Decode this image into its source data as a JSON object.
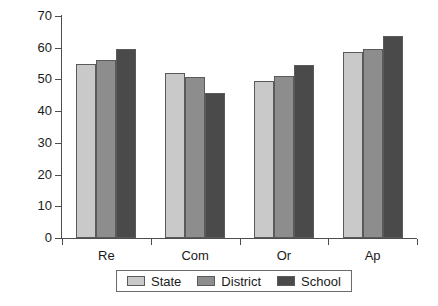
{
  "chart_data": {
    "type": "bar",
    "title": "",
    "subtitle": "",
    "xlabel": "",
    "ylabel": "",
    "categories": [
      "Re",
      "Com",
      "Or",
      "Ap"
    ],
    "series": [
      {
        "name": "State",
        "color": "#c9c9c9",
        "values": [
          55.0,
          52.0,
          49.5,
          58.7
        ]
      },
      {
        "name": "District",
        "color": "#8d8d8d",
        "values": [
          56.0,
          50.8,
          51.0,
          59.7
        ]
      },
      {
        "name": "School",
        "color": "#4a4a4a",
        "values": [
          59.7,
          45.7,
          54.5,
          63.6
        ]
      }
    ],
    "ylim": [
      0,
      70
    ],
    "ytick_values": [
      0,
      10,
      20,
      30,
      40,
      50,
      60,
      70
    ],
    "ytick_labels": [
      "0",
      "10",
      "20",
      "30",
      "40",
      "50",
      "60",
      "70"
    ],
    "grid": false,
    "legend_position": "bottom",
    "legend_entries": [
      "State",
      "District",
      "School"
    ],
    "axis_color": "#4d4d4d",
    "bar_edge_color": "#5a5a5a",
    "background_color": "#ffffff"
  }
}
